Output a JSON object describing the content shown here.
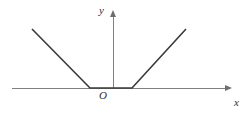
{
  "figure": {
    "background_color": "#ffffff",
    "width": 250,
    "height": 116,
    "axis_color": "#808080",
    "curve_color": "#3a3a3a",
    "axis_stroke_width": 1,
    "curve_stroke_width": 1.6,
    "labels": {
      "y_axis": "y",
      "x_axis": "x",
      "origin": "O"
    }
  },
  "chart_data": {
    "type": "line",
    "title": "",
    "subtitle": "",
    "xlabel": "x",
    "ylabel": "y",
    "grid": false,
    "legend": null,
    "annotations": [
      "O"
    ],
    "axes": {
      "origin_px": {
        "x": 113,
        "y": 88
      },
      "x_axis_px": {
        "x_start": 12,
        "x_end": 232,
        "y": 88,
        "arrow_end": "right"
      },
      "y_axis_px": {
        "y_start": 10,
        "y_end": 88,
        "x": 113,
        "arrow_end": "top"
      }
    },
    "series": [
      {
        "name": "piecewise-linear-curve",
        "points_px": [
          {
            "x": 32,
            "y": 29
          },
          {
            "x": 90,
            "y": 88
          },
          {
            "x": 132,
            "y": 88
          },
          {
            "x": 186,
            "y": 29
          }
        ],
        "segments": [
          {
            "name": "left-descending-branch",
            "from_px": {
              "x": 32,
              "y": 29
            },
            "to_px": {
              "x": 90,
              "y": 88
            }
          },
          {
            "name": "flat-middle-segment",
            "from_px": {
              "x": 90,
              "y": 88
            },
            "to_px": {
              "x": 132,
              "y": 88
            }
          },
          {
            "name": "right-ascending-branch",
            "from_px": {
              "x": 132,
              "y": 88
            },
            "to_px": {
              "x": 186,
              "y": 29
            }
          }
        ]
      }
    ]
  }
}
